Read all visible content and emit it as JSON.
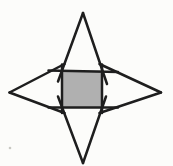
{
  "figure": {
    "canvas": {
      "width": 173,
      "height": 166,
      "background": "#fcfcfa"
    },
    "stroke": {
      "color": "#1e1e1e",
      "width": 2.5
    },
    "square": {
      "x": 62,
      "y": 70.5,
      "width": 40,
      "height": 37,
      "fill": "#b0b0b0",
      "name": "shaded-square"
    },
    "star_tips": {
      "top": {
        "x": 83,
        "y": 13
      },
      "bottom": {
        "x": 83,
        "y": 163
      },
      "left": {
        "x": 9.5,
        "y": 92.5
      },
      "right": {
        "x": 161,
        "y": 92.5
      }
    },
    "lines": [
      {
        "name": "top-triangle-left-side",
        "x1": 83,
        "y1": 13,
        "x2": 58,
        "y2": 81.5
      },
      {
        "name": "top-triangle-right-side",
        "x1": 83,
        "y1": 13,
        "x2": 107,
        "y2": 84
      },
      {
        "name": "bottom-triangle-left-side",
        "x1": 83,
        "y1": 163,
        "x2": 58,
        "y2": 96.5
      },
      {
        "name": "bottom-triangle-right-side",
        "x1": 83,
        "y1": 163,
        "x2": 106,
        "y2": 96.5
      },
      {
        "name": "left-triangle-top-side",
        "x1": 9.5,
        "y1": 92.5,
        "x2": 64.5,
        "y2": 64
      },
      {
        "name": "left-triangle-bottom-side",
        "x1": 9.5,
        "y1": 92.5,
        "x2": 64.5,
        "y2": 113
      },
      {
        "name": "right-triangle-top-side",
        "x1": 161,
        "y1": 92.5,
        "x2": 99.5,
        "y2": 64
      },
      {
        "name": "right-triangle-bottom-side",
        "x1": 161,
        "y1": 92.5,
        "x2": 99.5,
        "y2": 113
      },
      {
        "name": "square-top-edge-line",
        "x1": 48.5,
        "y1": 70.5,
        "x2": 118,
        "y2": 72
      },
      {
        "name": "square-bottom-edge-line",
        "x1": 48.5,
        "y1": 107.5,
        "x2": 118,
        "y2": 107.5
      },
      {
        "name": "square-left-edge-line",
        "x1": 62,
        "y1": 64.5,
        "x2": 62,
        "y2": 113
      },
      {
        "name": "square-right-edge-line",
        "x1": 102,
        "y1": 64.5,
        "x2": 102,
        "y2": 113
      }
    ],
    "speck": {
      "x": 10,
      "y": 148,
      "radius": 1.3,
      "color": "#c8c8c2"
    }
  }
}
